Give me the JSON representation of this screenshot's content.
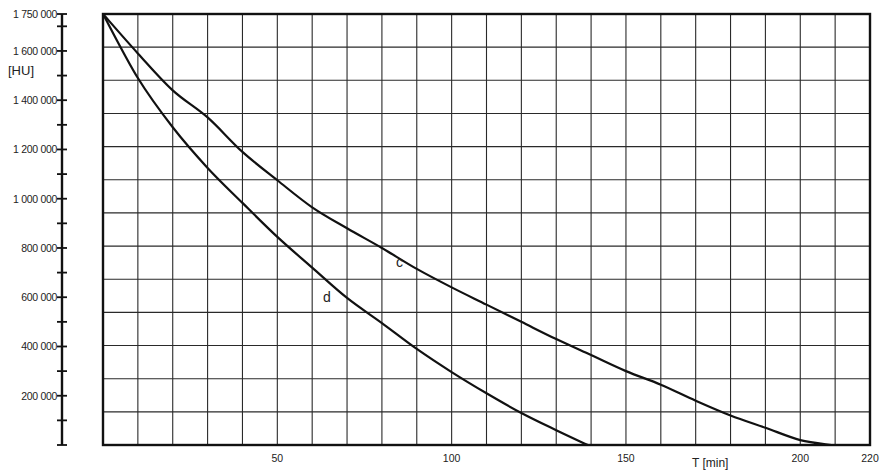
{
  "chart_data": {
    "type": "line",
    "title": "",
    "xlabel": "T [min]",
    "ylabel": "[HU]",
    "xlim": [
      0,
      220
    ],
    "ylim": [
      0,
      1750000
    ],
    "grid": true,
    "x_tick_labels": [
      "50",
      "100",
      "150",
      "200",
      "220"
    ],
    "x_ticks": [
      50,
      100,
      150,
      200,
      220
    ],
    "y_tick_labels": [
      "1 750 000",
      "1 600 000",
      "1 400 000",
      "1 200 000",
      "1 000 000",
      "800 000",
      "600 000",
      "400 000",
      "200 000"
    ],
    "y_ticks": [
      1750000,
      1600000,
      1400000,
      1200000,
      1000000,
      800000,
      600000,
      400000,
      200000
    ],
    "legend": "none (curves labeled inline)",
    "series": [
      {
        "name": "c",
        "x": [
          0,
          10,
          20,
          30,
          40,
          50,
          60,
          70,
          80,
          90,
          100,
          110,
          120,
          130,
          140,
          150,
          160,
          170,
          180,
          190,
          200,
          209
        ],
        "values": [
          1750000,
          1590000,
          1440000,
          1330000,
          1190000,
          1075000,
          965000,
          880000,
          800000,
          715000,
          640000,
          570000,
          500000,
          430000,
          365000,
          300000,
          245000,
          180000,
          120000,
          70000,
          20000,
          0
        ],
        "label_position": {
          "x": 92,
          "y": 720000
        }
      },
      {
        "name": "d",
        "x": [
          0,
          10,
          20,
          30,
          40,
          50,
          60,
          70,
          80,
          90,
          100,
          110,
          120,
          130,
          139
        ],
        "values": [
          1750000,
          1490000,
          1290000,
          1125000,
          983000,
          845000,
          720000,
          597000,
          495000,
          390000,
          296000,
          210000,
          130000,
          60000,
          0
        ],
        "label_position": {
          "x": 64,
          "y": 560000
        }
      }
    ]
  },
  "labels": {
    "y_unit": "[HU]",
    "x_unit": "T [min]",
    "curve_c": "c",
    "curve_d": "d"
  }
}
